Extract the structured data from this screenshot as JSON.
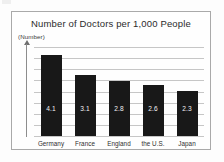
{
  "figure": {
    "title": "Number of Doctors per 1,000 People",
    "y_axis_unit_label": "(Number)"
  },
  "chart_data": {
    "type": "bar",
    "title": "Number of Doctors per 1,000 People",
    "xlabel": "",
    "ylabel": "(Number)",
    "categories": [
      "Germany",
      "France",
      "England",
      "the U.S.",
      "Japan"
    ],
    "values": [
      4.1,
      3.1,
      2.8,
      2.6,
      2.3
    ],
    "value_labels": [
      "4.1",
      "3.1",
      "2.8",
      "2.6",
      "2.3"
    ],
    "ylim": [
      0,
      4.5
    ],
    "grid": true,
    "gridline_count": 9,
    "legend": null,
    "bar_color": "#181818",
    "value_label_color": "#f2f2f2",
    "gridline_color": "#c6c6c6",
    "frame_color": "#a9a9a9",
    "background_color": "#fefefe"
  }
}
